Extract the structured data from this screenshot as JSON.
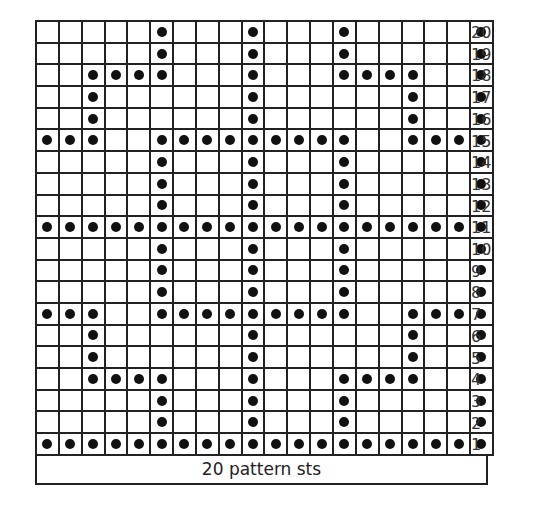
{
  "chart_data": {
    "type": "table",
    "columns": 20,
    "rows": 20,
    "footer_label": "20 pattern sts",
    "row_labels": [
      "20",
      "19",
      "18",
      "17",
      "16",
      "15",
      "14",
      "13",
      "12",
      "11",
      "10",
      "9",
      "8",
      "7",
      "6",
      "5",
      "4",
      "3",
      "2",
      "1"
    ],
    "symbol": "filled-dot",
    "dot_positions_by_row": {
      "20": [
        6,
        10,
        14,
        20
      ],
      "19": [
        6,
        10,
        14,
        20
      ],
      "18": [
        3,
        4,
        5,
        6,
        10,
        14,
        15,
        16,
        17,
        20
      ],
      "17": [
        3,
        10,
        17,
        20
      ],
      "16": [
        3,
        10,
        17,
        20
      ],
      "15": [
        1,
        2,
        3,
        6,
        7,
        8,
        9,
        10,
        11,
        12,
        13,
        14,
        17,
        18,
        19,
        20
      ],
      "14": [
        6,
        10,
        14,
        20
      ],
      "13": [
        6,
        10,
        14,
        20
      ],
      "12": [
        6,
        10,
        14,
        20
      ],
      "11": [
        1,
        2,
        3,
        4,
        5,
        6,
        7,
        8,
        9,
        10,
        11,
        12,
        13,
        14,
        15,
        16,
        17,
        18,
        19,
        20
      ],
      "10": [
        6,
        10,
        14,
        20
      ],
      "9": [
        6,
        10,
        14,
        20
      ],
      "8": [
        6,
        10,
        14,
        20
      ],
      "7": [
        1,
        2,
        3,
        6,
        7,
        8,
        9,
        10,
        11,
        12,
        13,
        14,
        17,
        18,
        19,
        20
      ],
      "6": [
        3,
        10,
        17,
        20
      ],
      "5": [
        3,
        10,
        17,
        20
      ],
      "4": [
        3,
        4,
        5,
        6,
        10,
        14,
        15,
        16,
        17,
        20
      ],
      "3": [
        6,
        10,
        14,
        20
      ],
      "2": [
        6,
        10,
        14,
        20
      ],
      "1": [
        1,
        2,
        3,
        4,
        5,
        6,
        7,
        8,
        9,
        10,
        11,
        12,
        13,
        14,
        15,
        16,
        17,
        18,
        19,
        20
      ]
    }
  },
  "footer": {
    "label": "20 pattern sts"
  },
  "colors": {
    "grid": "#222222",
    "dot": "#111111",
    "background": "#ffffff"
  }
}
